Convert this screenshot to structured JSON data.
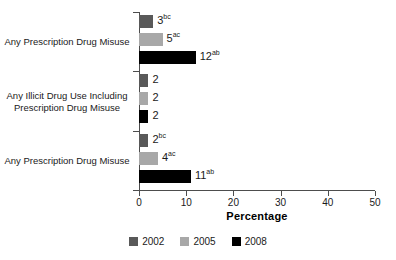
{
  "chart_data": {
    "type": "bar",
    "orientation": "horizontal",
    "title": "",
    "xlabel": "Percentage",
    "ylabel": "",
    "xlim": [
      0,
      50
    ],
    "xticks": [
      0,
      10,
      20,
      30,
      40,
      50
    ],
    "xtick_labels": [
      "0",
      "10",
      "20",
      "30",
      "40",
      "50"
    ],
    "grid": false,
    "legend_position": "bottom",
    "categories": [
      "Any Prescription Drug Misuse",
      "Any Illicit Drug Use Including Prescription Drug Misuse",
      "Any Prescription Drug Misuse"
    ],
    "series": [
      {
        "name": "2002",
        "color": "#595959",
        "values": [
          3,
          2,
          2
        ]
      },
      {
        "name": "2005",
        "color": "#a8a8a8",
        "values": [
          5,
          2,
          4
        ]
      },
      {
        "name": "2008",
        "color": "#000000",
        "values": [
          12,
          2,
          11
        ]
      }
    ],
    "groups": [
      {
        "category_lines": [
          "Any Prescription Drug Misuse"
        ],
        "bars": [
          {
            "series": "2002",
            "value": 3,
            "label": "3",
            "superscript": "bc"
          },
          {
            "series": "2005",
            "value": 5,
            "label": "5",
            "superscript": "ac"
          },
          {
            "series": "2008",
            "value": 12,
            "label": "12",
            "superscript": "ab"
          }
        ]
      },
      {
        "category_lines": [
          "Any Illicit Drug Use Including",
          "Prescription Drug Misuse"
        ],
        "bars": [
          {
            "series": "2002",
            "value": 2,
            "label": "2",
            "superscript": ""
          },
          {
            "series": "2005",
            "value": 2,
            "label": "2",
            "superscript": ""
          },
          {
            "series": "2008",
            "value": 2,
            "label": "2",
            "superscript": ""
          }
        ]
      },
      {
        "category_lines": [
          "Any Prescription Drug Misuse"
        ],
        "bars": [
          {
            "series": "2002",
            "value": 2,
            "label": "2",
            "superscript": "bc"
          },
          {
            "series": "2005",
            "value": 4,
            "label": "4",
            "superscript": "ac"
          },
          {
            "series": "2008",
            "value": 11,
            "label": "11",
            "superscript": "ab"
          }
        ]
      }
    ]
  },
  "legend": {
    "items": [
      {
        "label": "2002",
        "color": "#595959"
      },
      {
        "label": "2005",
        "color": "#a8a8a8"
      },
      {
        "label": "2008",
        "color": "#000000"
      }
    ]
  },
  "axis": {
    "x_title": "Percentage"
  }
}
